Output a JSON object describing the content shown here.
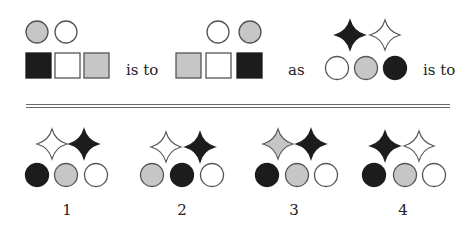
{
  "colors": {
    "black": "#1c1c1c",
    "gray": "#c6c6c6",
    "white": "#ffffff",
    "stroke": "#555555"
  },
  "question": {
    "connectors": [
      {
        "text": "is to",
        "x": 126,
        "y": 63
      },
      {
        "text": "as",
        "x": 288,
        "y": 63
      },
      {
        "text": "is to",
        "x": 423,
        "y": 63
      }
    ],
    "groups": [
      {
        "name": "figure-a",
        "shapes": [
          {
            "type": "circle",
            "fill": "gray",
            "cx": 37,
            "cy": 32,
            "r": 11
          },
          {
            "type": "circle",
            "fill": "white",
            "cx": 66,
            "cy": 32,
            "r": 11
          },
          {
            "type": "square",
            "fill": "black",
            "x": 26,
            "y": 53,
            "size": 25
          },
          {
            "type": "square",
            "fill": "white",
            "x": 55,
            "y": 53,
            "size": 25
          },
          {
            "type": "square",
            "fill": "gray",
            "x": 84,
            "y": 53,
            "size": 25
          }
        ]
      },
      {
        "name": "figure-b",
        "shapes": [
          {
            "type": "circle",
            "fill": "white",
            "cx": 218,
            "cy": 32,
            "r": 11
          },
          {
            "type": "circle",
            "fill": "gray",
            "cx": 250,
            "cy": 32,
            "r": 11
          },
          {
            "type": "square",
            "fill": "gray",
            "x": 176,
            "y": 53,
            "size": 25
          },
          {
            "type": "square",
            "fill": "white",
            "x": 206,
            "y": 53,
            "size": 25
          },
          {
            "type": "square",
            "fill": "black",
            "x": 237,
            "y": 53,
            "size": 25
          }
        ]
      },
      {
        "name": "figure-c",
        "shapes": [
          {
            "type": "star",
            "fill": "black",
            "cx": 350,
            "cy": 35,
            "r": 15
          },
          {
            "type": "star",
            "fill": "white",
            "cx": 385,
            "cy": 35,
            "r": 15
          },
          {
            "type": "circle",
            "fill": "white",
            "cx": 337,
            "cy": 68,
            "r": 11.5
          },
          {
            "type": "circle",
            "fill": "gray",
            "cx": 366,
            "cy": 68,
            "r": 11.5
          },
          {
            "type": "circle",
            "fill": "black",
            "cx": 395,
            "cy": 68,
            "r": 11.5
          }
        ]
      }
    ]
  },
  "separator": {
    "y1": 104,
    "y2": 107
  },
  "options": [
    {
      "number": "1",
      "label_x": 67,
      "shapes": [
        {
          "type": "star",
          "fill": "white",
          "cx": 52,
          "cy": 144,
          "r": 15
        },
        {
          "type": "star",
          "fill": "black",
          "cx": 84,
          "cy": 144,
          "r": 15
        },
        {
          "type": "circle",
          "fill": "black",
          "cx": 37,
          "cy": 175,
          "r": 11.5
        },
        {
          "type": "circle",
          "fill": "gray",
          "cx": 66,
          "cy": 175,
          "r": 11.5
        },
        {
          "type": "circle",
          "fill": "white",
          "cx": 96,
          "cy": 175,
          "r": 11.5
        }
      ]
    },
    {
      "number": "2",
      "label_x": 182,
      "shapes": [
        {
          "type": "star",
          "fill": "white",
          "cx": 166,
          "cy": 147,
          "r": 15
        },
        {
          "type": "star",
          "fill": "black",
          "cx": 200,
          "cy": 147,
          "r": 15
        },
        {
          "type": "circle",
          "fill": "gray",
          "cx": 152,
          "cy": 175,
          "r": 11.5
        },
        {
          "type": "circle",
          "fill": "black",
          "cx": 182,
          "cy": 175,
          "r": 11.5
        },
        {
          "type": "circle",
          "fill": "white",
          "cx": 212,
          "cy": 175,
          "r": 11.5
        }
      ]
    },
    {
      "number": "3",
      "label_x": 294,
      "shapes": [
        {
          "type": "star",
          "fill": "gray",
          "cx": 278,
          "cy": 144,
          "r": 15
        },
        {
          "type": "star",
          "fill": "black",
          "cx": 311,
          "cy": 144,
          "r": 15
        },
        {
          "type": "circle",
          "fill": "black",
          "cx": 267,
          "cy": 175,
          "r": 11.5
        },
        {
          "type": "circle",
          "fill": "gray",
          "cx": 297,
          "cy": 175,
          "r": 11.5
        },
        {
          "type": "circle",
          "fill": "white",
          "cx": 326,
          "cy": 175,
          "r": 11.5
        }
      ]
    },
    {
      "number": "4",
      "label_x": 403,
      "shapes": [
        {
          "type": "star",
          "fill": "black",
          "cx": 385,
          "cy": 146,
          "r": 15
        },
        {
          "type": "star",
          "fill": "white",
          "cx": 419,
          "cy": 146,
          "r": 15
        },
        {
          "type": "circle",
          "fill": "black",
          "cx": 374,
          "cy": 175,
          "r": 11.5
        },
        {
          "type": "circle",
          "fill": "gray",
          "cx": 405,
          "cy": 175,
          "r": 11.5
        },
        {
          "type": "circle",
          "fill": "white",
          "cx": 434,
          "cy": 175,
          "r": 11.5
        }
      ]
    }
  ]
}
